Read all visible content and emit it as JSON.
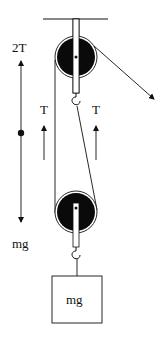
{
  "diagram": {
    "type": "pulley-system-free-body",
    "colors": {
      "ink": "#111111",
      "pulley_fill": "#0a0a0a",
      "background": "#ffffff"
    },
    "free_body": {
      "up_label": "2T",
      "down_label": "mg"
    },
    "tension_labels": {
      "left": "T",
      "right": "T"
    },
    "mass_block": {
      "label": "mg"
    }
  }
}
